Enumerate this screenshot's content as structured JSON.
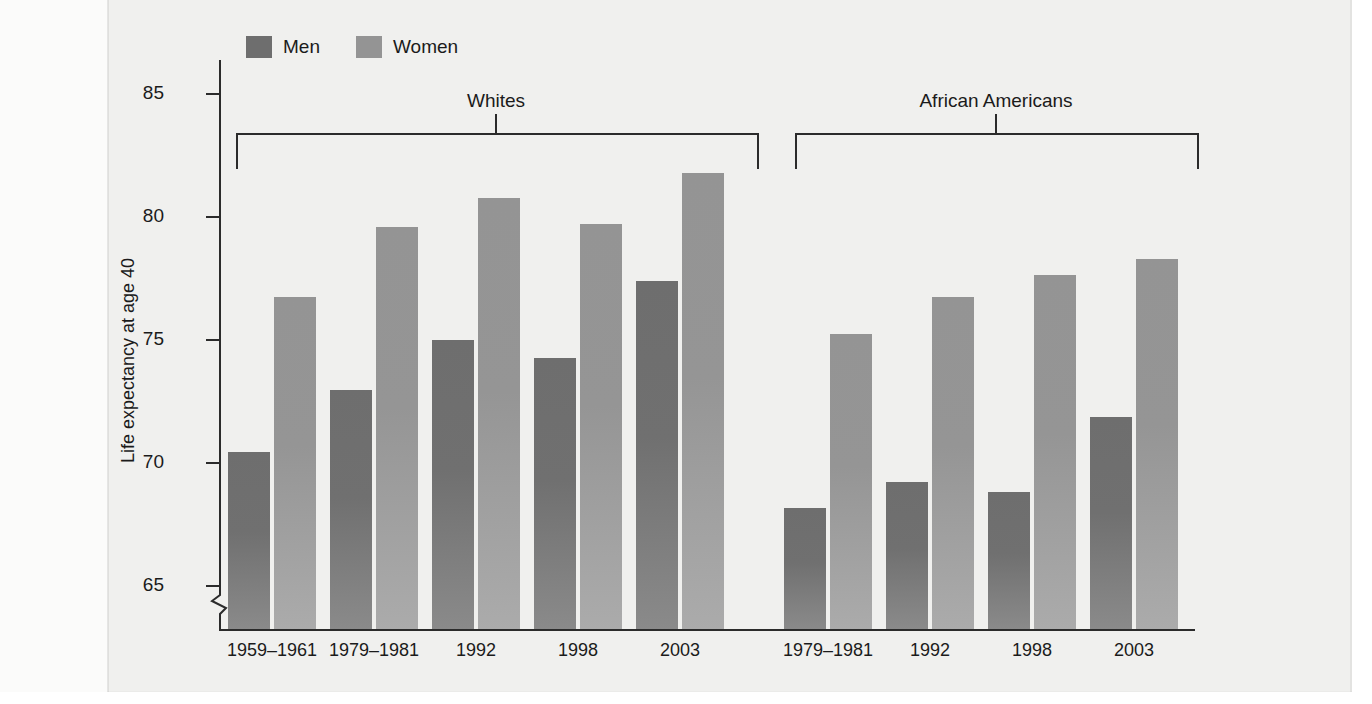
{
  "chart_data": {
    "type": "bar",
    "title": "",
    "xlabel": "",
    "ylabel": "Life expectancy at age 40",
    "ylim": [
      65,
      85
    ],
    "y_ticks": [
      65,
      70,
      75,
      80,
      85
    ],
    "axis_break": true,
    "grid": false,
    "legend_position": "top-left",
    "legend": [
      "Men",
      "Women"
    ],
    "groups": [
      {
        "label": "Whites",
        "categories": [
          "1959–1961",
          "1979–1981",
          "1992",
          "1998",
          "2003"
        ],
        "series": [
          {
            "name": "Men",
            "values": [
              71.6,
              73.9,
              75.8,
              75.1,
              78.0
            ]
          },
          {
            "name": "Women",
            "values": [
              77.4,
              80.0,
              81.1,
              80.1,
              82.0
            ]
          }
        ]
      },
      {
        "label": "African Americans",
        "categories": [
          "1979–1981",
          "1992",
          "1998",
          "2003"
        ],
        "series": [
          {
            "name": "Men",
            "values": [
              69.5,
              70.5,
              70.1,
              72.9
            ]
          },
          {
            "name": "Women",
            "values": [
              76.0,
              77.4,
              78.2,
              78.8
            ]
          }
        ]
      }
    ],
    "colors": {
      "men": "#6e6e6e",
      "women": "#949494",
      "axis": "#2b2b2b",
      "text": "#1b1b1b",
      "background": "#f0f0ee"
    }
  },
  "legend": {
    "men_label": "Men",
    "women_label": "Women"
  },
  "axis": {
    "y_title": "Life expectancy at age 40",
    "tick_85": "85",
    "tick_80": "80",
    "tick_75": "75",
    "tick_70": "70",
    "tick_65": "65"
  },
  "brackets": {
    "whites": "Whites",
    "african_americans": "African Americans"
  },
  "x_labels": {
    "w0": "1959–1961",
    "w1": "1979–1981",
    "w2": "1992",
    "w3": "1998",
    "w4": "2003",
    "a0": "1979–1981",
    "a1": "1992",
    "a2": "1998",
    "a3": "2003"
  }
}
